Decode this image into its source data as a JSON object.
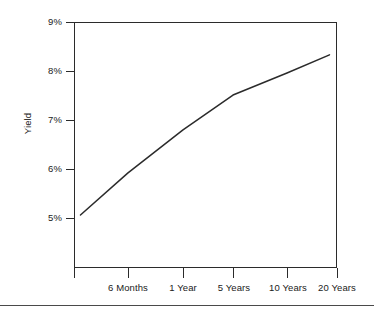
{
  "chart_data": {
    "type": "line",
    "title": "",
    "subtitle": "",
    "xlabel": "",
    "ylabel": "Yield",
    "grid": false,
    "legend": "none",
    "categories": [
      "",
      "6 Months",
      "1 Year",
      "5 Years",
      "10 Years",
      "20 Years"
    ],
    "x_tick_labels": [
      "",
      "6 Months",
      "1 Year",
      "5 Years",
      "10 Years",
      "20 Years"
    ],
    "y_tick_labels": [
      "5%",
      "6%",
      "7%",
      "8%",
      "9%"
    ],
    "y_tick_values": [
      5,
      6,
      7,
      8,
      9
    ],
    "ylim": [
      4.0,
      9.0
    ],
    "y_unit": "%",
    "series": [
      {
        "name": "Yield curve",
        "color": "#2b2b2b",
        "points": [
          {
            "x_label": "",
            "x_pos": 0.12,
            "value": 5.06
          },
          {
            "x_label": "6 Months",
            "x_pos": 1.0,
            "value": 5.92
          },
          {
            "x_label": "1 Year",
            "x_pos": 2.0,
            "value": 6.8
          },
          {
            "x_label": "5 Years",
            "x_pos": 3.0,
            "value": 7.51
          },
          {
            "x_label": "10 Years",
            "x_pos": 4.0,
            "value": 7.96
          },
          {
            "x_label": "20 Years",
            "x_pos": 4.85,
            "value": 8.33
          }
        ],
        "values": [
          5.06,
          5.92,
          6.8,
          7.51,
          7.96,
          8.33
        ]
      }
    ],
    "axis_color": "#2b2b2b",
    "background_color": "#ffffff"
  },
  "figure": {
    "y_ticks": [
      {
        "label": "9%",
        "top": 22
      },
      {
        "label": "8%",
        "top": 71
      },
      {
        "label": "7%",
        "top": 120
      },
      {
        "label": "6%",
        "top": 169
      },
      {
        "label": "5%",
        "top": 218
      }
    ],
    "x_ticks": [
      {
        "label": "",
        "left": 74
      },
      {
        "label": "6 Months",
        "left": 128
      },
      {
        "label": "1 Year",
        "left": 183
      },
      {
        "label": "5 Years",
        "left": 233
      },
      {
        "label": "10 Years",
        "left": 287
      },
      {
        "label": "20 Years",
        "left": 337
      }
    ],
    "ylabel": "Yield"
  }
}
